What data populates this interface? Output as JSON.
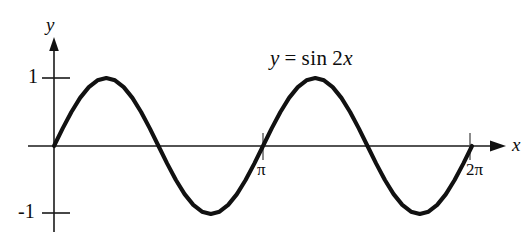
{
  "figure": {
    "name": "sine-curve-plot",
    "background_color": "#ffffff",
    "ink_color": "#111111"
  },
  "labels": {
    "y_axis": "y",
    "x_axis": "x",
    "y_tick_positive": "1",
    "y_tick_negative": "-1",
    "x_tick_pi": "π",
    "x_tick_twopi": "2π"
  },
  "equation": {
    "lhs": "y",
    "operator": "=",
    "func": "sin",
    "coefficient": "2",
    "variable": "x",
    "full_text": "y = sin 2x"
  },
  "chart_data": {
    "type": "line",
    "title": "",
    "subtitle": "",
    "xlabel": "x",
    "ylabel": "y",
    "annotations": [
      {
        "text": "y = sin 2x",
        "x": 2.0,
        "y": 1.55
      }
    ],
    "grid": false,
    "legend": null,
    "xlim": [
      0,
      6.283185307179586
    ],
    "ylim": [
      -1.35,
      1.55
    ],
    "xticks": [
      3.141592653589793,
      6.283185307179586
    ],
    "xticklabels": [
      "π",
      "2π"
    ],
    "yticks": [
      -1,
      1
    ],
    "yticklabels": [
      "-1",
      "1"
    ],
    "series": [
      {
        "name": "y = sin 2x",
        "color": "#111111",
        "expression": "sin(2x)",
        "x": [
          0.0,
          0.1309,
          0.2618,
          0.3927,
          0.5236,
          0.6545,
          0.7854,
          0.9163,
          1.0472,
          1.1781,
          1.309,
          1.4399,
          1.5708,
          1.7017,
          1.8326,
          1.9635,
          2.0944,
          2.2253,
          2.3562,
          2.4871,
          2.618,
          2.7489,
          2.8798,
          3.0107,
          3.1416,
          3.2725,
          3.4034,
          3.5343,
          3.6652,
          3.7961,
          3.927,
          4.0579,
          4.1888,
          4.3197,
          4.4506,
          4.5815,
          4.7124,
          4.8433,
          4.9742,
          5.1051,
          5.236,
          5.3669,
          5.4978,
          5.6287,
          5.7596,
          5.8905,
          6.0214,
          6.1523,
          6.2832
        ],
        "y": [
          0.0,
          0.2588,
          0.5,
          0.7071,
          0.866,
          0.9659,
          1.0,
          0.9659,
          0.866,
          0.7071,
          0.5,
          0.2588,
          0.0,
          -0.2588,
          -0.5,
          -0.7071,
          -0.866,
          -0.9659,
          -1.0,
          -0.9659,
          -0.866,
          -0.7071,
          -0.5,
          -0.2588,
          0.0,
          0.2588,
          0.5,
          0.7071,
          0.866,
          0.9659,
          1.0,
          0.9659,
          0.866,
          0.7071,
          0.5,
          0.2588,
          0.0,
          -0.2588,
          -0.5,
          -0.7071,
          -0.866,
          -0.9659,
          -1.0,
          -0.9659,
          -0.866,
          -0.7071,
          -0.5,
          -0.2588,
          0.0
        ]
      }
    ],
    "key_points": {
      "maxima": [
        {
          "x": 0.7854,
          "y": 1
        },
        {
          "x": 3.927,
          "y": 1
        }
      ],
      "minima": [
        {
          "x": 2.3562,
          "y": -1
        },
        {
          "x": 5.4978,
          "y": -1
        }
      ],
      "zeros": [
        0.0,
        1.5708,
        3.141592653589793,
        4.712388980384689,
        6.283185307179586
      ],
      "amplitude": 1,
      "period": 3.141592653589793
    }
  }
}
